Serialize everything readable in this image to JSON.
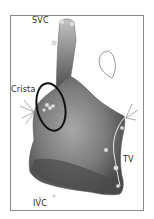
{
  "figure": {
    "type": "electroanatomical-map",
    "labels": {
      "svc": "SVC",
      "crista": "Crista",
      "tv": "TV",
      "ivc": "IVC"
    },
    "colors": {
      "frame": "#8a8a8a",
      "map_dark": "#4a4a4a",
      "map_mid": "#7d7d7d",
      "map_light": "#b8b8b8",
      "ellipse": "#111111",
      "markers": "#9a9a9a"
    }
  }
}
